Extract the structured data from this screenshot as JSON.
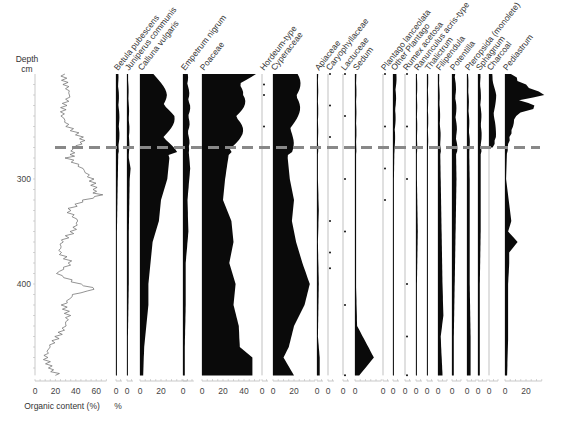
{
  "chart_data": {
    "type": "area",
    "subtype": "pollen-stratigraphic-diagram",
    "title": "",
    "ylabel": "Depth cm",
    "y_ticks": [
      300,
      400
    ],
    "ylim": [
      200,
      487
    ],
    "y_inverted": true,
    "marker_line": {
      "depth": 270,
      "style": "dashed",
      "color": "#888888"
    },
    "organic_content": {
      "xlabel": "Organic content (%)",
      "x_ticks": [
        0,
        20,
        40,
        60
      ],
      "xlim": [
        0,
        70
      ],
      "depths": [
        200,
        210,
        220,
        230,
        240,
        250,
        260,
        265,
        270,
        275,
        280,
        290,
        300,
        310,
        315,
        320,
        330,
        340,
        350,
        360,
        370,
        380,
        390,
        400,
        405,
        410,
        420,
        430,
        440,
        450,
        460,
        470,
        480,
        487
      ],
      "values": [
        30,
        32,
        35,
        28,
        25,
        30,
        42,
        50,
        35,
        40,
        30,
        45,
        55,
        60,
        62,
        50,
        35,
        45,
        40,
        28,
        25,
        35,
        20,
        40,
        62,
        35,
        25,
        30,
        28,
        22,
        15,
        12,
        18,
        20
      ]
    },
    "pollen_xlabel": "%",
    "taxa": [
      {
        "name": "Betula pubescens",
        "x_ticks": [
          0
        ],
        "max": 5,
        "depths": [
          200,
          250,
          300,
          350,
          400,
          450,
          487
        ],
        "values": [
          2,
          3,
          2,
          1,
          1,
          1,
          1
        ]
      },
      {
        "name": "Juniperus communis",
        "x_ticks": [
          0
        ],
        "max": 5,
        "depths": [
          200,
          250,
          280,
          290,
          300,
          350,
          400,
          450,
          487
        ],
        "values": [
          1,
          2,
          2,
          4,
          3,
          2,
          2,
          1,
          1
        ]
      },
      {
        "name": "Calluna vulgaris",
        "x_ticks": [
          0,
          20
        ],
        "max": 45,
        "depths": [
          200,
          220,
          240,
          260,
          280,
          300,
          320,
          340,
          360,
          380,
          400,
          420,
          440,
          460,
          487
        ],
        "values": [
          12,
          20,
          25,
          22,
          28,
          26,
          20,
          18,
          12,
          10,
          8,
          8,
          6,
          4,
          3
        ]
      },
      {
        "name": "Empetrum nigrum",
        "x_ticks": [
          0
        ],
        "max": 12,
        "depths": [
          200,
          230,
          260,
          290,
          320,
          350,
          380,
          420,
          460,
          487
        ],
        "values": [
          4,
          6,
          5,
          8,
          5,
          6,
          3,
          3,
          2,
          2
        ]
      },
      {
        "name": "Poaceae",
        "x_ticks": [
          0,
          20,
          40
        ],
        "max": 55,
        "depths": [
          200,
          220,
          240,
          260,
          280,
          300,
          320,
          340,
          360,
          380,
          400,
          420,
          440,
          460,
          470,
          487
        ],
        "values": [
          40,
          30,
          32,
          28,
          25,
          22,
          20,
          28,
          30,
          26,
          32,
          30,
          35,
          36,
          48,
          48
        ]
      },
      {
        "name": "Hordeum-type",
        "x_ticks": [
          0
        ],
        "max": 5,
        "depths": [
          210,
          220,
          250,
          270
        ],
        "values": [
          1,
          1,
          1,
          1
        ]
      },
      {
        "name": "Cyperaceae",
        "x_ticks": [
          0,
          20
        ],
        "max": 40,
        "depths": [
          200,
          220,
          240,
          260,
          280,
          300,
          320,
          340,
          360,
          380,
          400,
          420,
          440,
          460,
          470,
          487
        ],
        "values": [
          18,
          22,
          18,
          15,
          14,
          16,
          20,
          18,
          22,
          28,
          35,
          30,
          20,
          15,
          10,
          20
        ]
      },
      {
        "name": "Apiaceae",
        "x_ticks": [
          0
        ],
        "max": 5,
        "depths": [
          200,
          250,
          300,
          330,
          360,
          400,
          450,
          470,
          487
        ],
        "values": [
          1,
          1,
          1,
          2,
          1,
          2,
          1,
          3,
          3
        ]
      },
      {
        "name": "Caryophyllaceae",
        "x_ticks": [
          0
        ],
        "max": 5,
        "depths": [
          200,
          230,
          260,
          340,
          370,
          385
        ],
        "values": [
          1,
          1,
          1,
          1,
          1,
          1
        ]
      },
      {
        "name": "Lactuceae",
        "x_ticks": [
          0
        ],
        "max": 5,
        "depths": [
          200,
          240,
          270,
          300,
          350,
          420,
          487
        ],
        "values": [
          1,
          1,
          1,
          1,
          1,
          1,
          1
        ]
      },
      {
        "name": "Sedum",
        "x_ticks": [
          0
        ],
        "max": 25,
        "depths": [
          200,
          250,
          300,
          350,
          400,
          440,
          470,
          487
        ],
        "values": [
          1,
          1,
          1,
          1,
          1,
          2,
          18,
          4
        ]
      },
      {
        "name": "Plantago lanceolata",
        "x_ticks": [
          0
        ],
        "max": 5,
        "depths": [
          200,
          250,
          290,
          320
        ],
        "values": [
          1,
          1,
          1,
          1
        ]
      },
      {
        "name": "Other Plantago",
        "x_ticks": [
          0
        ],
        "max": 5,
        "depths": [
          200,
          250,
          300,
          350,
          400,
          450,
          487
        ],
        "values": [
          3,
          2,
          1,
          1,
          1,
          1,
          1
        ]
      },
      {
        "name": "Rumex acetosa",
        "x_ticks": [
          0
        ],
        "max": 5,
        "depths": [
          200,
          250,
          300,
          400,
          450,
          487
        ],
        "values": [
          1,
          1,
          1,
          1,
          1,
          1
        ]
      },
      {
        "name": "Ranunculus acris-type",
        "x_ticks": [
          0
        ],
        "max": 5,
        "depths": [
          200,
          250,
          300,
          350,
          400,
          450,
          487
        ],
        "values": [
          1,
          1,
          1,
          2,
          1,
          1,
          1
        ]
      },
      {
        "name": "Thalictrum",
        "x_ticks": [
          0
        ],
        "max": 5,
        "depths": [
          200,
          250,
          300,
          350,
          400,
          450,
          487
        ],
        "values": [
          1,
          1,
          1,
          1,
          1,
          1,
          1
        ]
      },
      {
        "name": "Filipendula",
        "x_ticks": [
          0
        ],
        "max": 10,
        "depths": [
          200,
          250,
          300,
          350,
          400,
          430,
          450,
          487
        ],
        "values": [
          1,
          2,
          3,
          4,
          5,
          6,
          3,
          5
        ]
      },
      {
        "name": "Potentilla",
        "x_ticks": [
          0
        ],
        "max": 10,
        "depths": [
          200,
          250,
          300,
          350,
          400,
          450,
          487
        ],
        "values": [
          3,
          4,
          5,
          4,
          3,
          2,
          2
        ]
      },
      {
        "name": "Pteropsida (monolete)",
        "x_ticks": [
          0
        ],
        "max": 10,
        "depths": [
          200,
          250,
          300,
          350,
          400,
          450,
          487
        ],
        "values": [
          1,
          2,
          3,
          3,
          3,
          4,
          4
        ]
      },
      {
        "name": "Sphagnum",
        "x_ticks": [
          0
        ],
        "max": 10,
        "depths": [
          200,
          250,
          300,
          350,
          400,
          450,
          487
        ],
        "values": [
          2,
          3,
          3,
          3,
          2,
          2,
          2
        ]
      },
      {
        "name": "Charcoal",
        "x_ticks": [
          0
        ],
        "max": 10,
        "depths": [
          200,
          220,
          240,
          260,
          270
        ],
        "values": [
          3,
          6,
          5,
          6,
          4
        ]
      },
      {
        "name": "Pediastrum",
        "x_ticks": [
          0,
          20
        ],
        "max": 35,
        "depths": [
          200,
          210,
          220,
          225,
          230,
          240,
          250,
          260,
          270,
          300,
          340,
          350,
          360,
          370,
          380,
          400,
          450,
          487
        ],
        "values": [
          5,
          15,
          30,
          10,
          26,
          8,
          6,
          4,
          2,
          1,
          6,
          3,
          12,
          4,
          4,
          3,
          3,
          2
        ]
      }
    ]
  }
}
